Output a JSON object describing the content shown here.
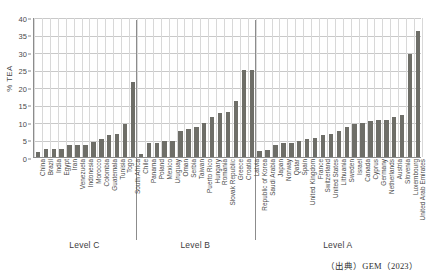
{
  "chart_data": {
    "type": "bar",
    "title": "",
    "xlabel": "",
    "ylabel": "% TEA",
    "ylim": [
      0,
      40
    ],
    "ytick_step": 5,
    "yticks": [
      0,
      5,
      10,
      15,
      20,
      25,
      30,
      35,
      40
    ],
    "grid": true,
    "legend": "none",
    "bar_color": "#6e6e68",
    "categories": [
      "China",
      "Brazil",
      "India",
      "Egypt",
      "Iran",
      "Venezuela",
      "Indonesia",
      "Morocco",
      "Colombia",
      "Guatemala",
      "Tunisia",
      "Togo",
      "South Africa",
      "Chile",
      "Panama",
      "Poland",
      "Mexico",
      "Uruguay",
      "Oman",
      "Serbia",
      "Taiwan",
      "Puerto Rico",
      "Hungary",
      "Romania",
      "Slovak Republic",
      "Greece",
      "Croatia",
      "Latvia",
      "Republic of Korea",
      "Saudi Arabia",
      "Japan",
      "Norway",
      "Qatar",
      "Spain",
      "United Kingdom",
      "France",
      "Switzerland",
      "United States",
      "Lithuania",
      "Sweden",
      "Israel",
      "Canada",
      "Cyprus",
      "Germany",
      "Netherlands",
      "Austria",
      "Slovenia",
      "Luxembourg",
      "United Arab Emirates"
    ],
    "values": [
      1.3,
      2.2,
      2.2,
      2.4,
      3.4,
      3.4,
      3.5,
      4.3,
      5.1,
      6.4,
      6.6,
      9.3,
      21.3,
      0.9,
      4.0,
      4.0,
      4.5,
      4.6,
      7.5,
      7.9,
      8.7,
      9.7,
      11.3,
      12.6,
      13.0,
      16.0,
      24.9,
      25.0,
      1.7,
      2.1,
      3.3,
      3.9,
      4.0,
      4.5,
      5.2,
      5.5,
      6.2,
      6.5,
      7.4,
      8.7,
      9.3,
      9.6,
      10.2,
      10.5,
      10.7,
      11.5,
      11.9,
      29.4,
      36.1
    ],
    "groups": [
      {
        "label": "Level C",
        "start_index": 0,
        "end_index": 12
      },
      {
        "label": "Level B",
        "start_index": 13,
        "end_index": 27
      },
      {
        "label": "Level A",
        "start_index": 28,
        "end_index": 48
      }
    ]
  },
  "source": {
    "note": "（出典）GEM（2023）"
  }
}
